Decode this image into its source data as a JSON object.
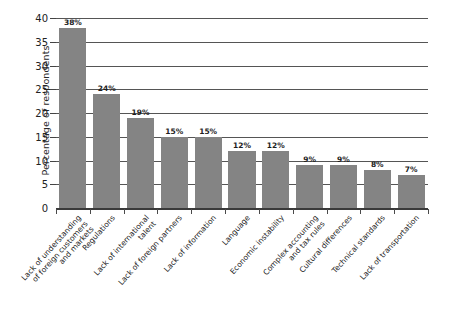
{
  "chart_data": {
    "type": "bar",
    "title": "",
    "subtitle": "",
    "xlabel": "",
    "ylabel": "Percentage of respondents",
    "ylim": [
      0,
      40
    ],
    "ytick_step": 5,
    "yticks": [
      "40",
      "35",
      "30",
      "25",
      "20",
      "15",
      "10",
      "5",
      "0"
    ],
    "grid": true,
    "legend": false,
    "bar_color": "#848484",
    "background_color": "#ffffff",
    "value_suffix": "%",
    "categories": [
      "Lack of understanding\nof foreign customers\nand markets",
      "Regulations",
      "Lack of international\ntalent",
      "Lack of foreign partners",
      "Lack of information",
      "Language",
      "Economic instability",
      "Complex accounting\nand tax rules",
      "Cultural differences",
      "Technical standards",
      "Lack of transportation"
    ],
    "values": [
      38,
      24,
      19,
      15,
      15,
      12,
      12,
      9,
      9,
      8,
      7
    ],
    "value_labels": [
      "38%",
      "24%",
      "19%",
      "15%",
      "15%",
      "12%",
      "12%",
      "9%",
      "9%",
      "8%",
      "7%"
    ]
  }
}
